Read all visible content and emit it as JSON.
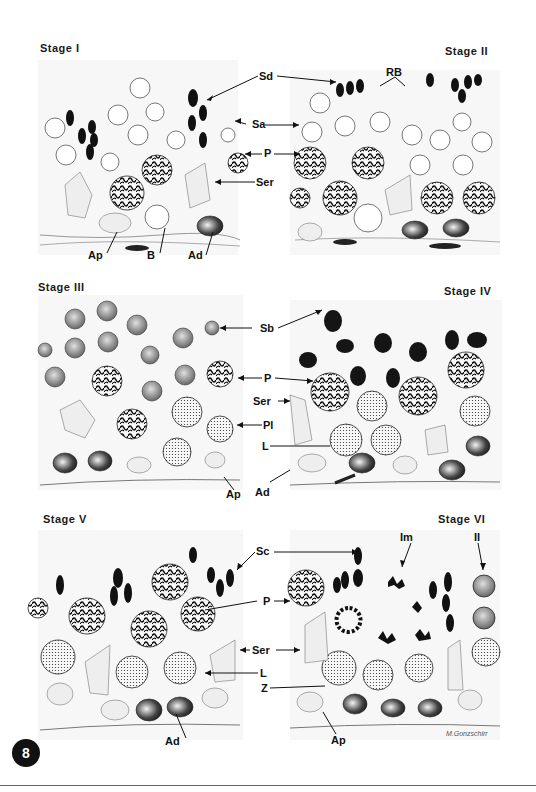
{
  "figure": {
    "number": "8",
    "signature": "M.Gonzschirr",
    "stages": [
      {
        "title": "Stage I"
      },
      {
        "title": "Stage II"
      },
      {
        "title": "Stage III"
      },
      {
        "title": "Stage IV"
      },
      {
        "title": "Stage V"
      },
      {
        "title": "Stage VI"
      }
    ],
    "labels": {
      "row1": {
        "sd": "Sd",
        "rb": "RB",
        "sa": "Sa",
        "p": "P",
        "ser": "Ser",
        "ap": "Ap",
        "b": "B",
        "ad": "Ad"
      },
      "row2": {
        "sb": "Sb",
        "p": "P",
        "ser": "Ser",
        "pl": "Pl",
        "l": "L",
        "ap": "Ap",
        "ad": "Ad"
      },
      "row3": {
        "sc": "Sc",
        "im": "Im",
        "ii": "II",
        "p": "P",
        "ser": "Ser",
        "l": "L",
        "z": "Z",
        "ad": "Ad",
        "ap": "Ap"
      }
    }
  }
}
